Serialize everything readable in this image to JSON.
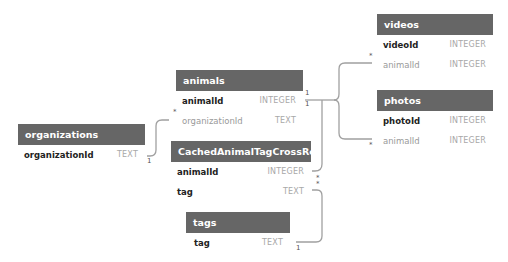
{
  "tables": {
    "organizations": {
      "name": "organizations",
      "columns": [
        {
          "name": "organizationId",
          "type": "TEXT",
          "key": "pk"
        }
      ]
    },
    "animals": {
      "name": "animals",
      "columns": [
        {
          "name": "animalId",
          "type": "INTEGER",
          "key": "pk"
        },
        {
          "name": "organizationId",
          "type": "TEXT",
          "key": "fk"
        }
      ]
    },
    "cachedAnimalTagCrossRef": {
      "name": "CachedAnimalTagCrossRef",
      "columns": [
        {
          "name": "animalId",
          "type": "INTEGER",
          "key": "pk"
        },
        {
          "name": "tag",
          "type": "TEXT",
          "key": "pk"
        }
      ]
    },
    "tags": {
      "name": "tags",
      "columns": [
        {
          "name": "tag",
          "type": "TEXT",
          "key": "pk"
        }
      ]
    },
    "videos": {
      "name": "videos",
      "columns": [
        {
          "name": "videoId",
          "type": "INTEGER",
          "key": "pk"
        },
        {
          "name": "animalId",
          "type": "INTEGER",
          "key": "fk"
        }
      ]
    },
    "photos": {
      "name": "photos",
      "columns": [
        {
          "name": "photoId",
          "type": "INTEGER",
          "key": "pk"
        },
        {
          "name": "animalId",
          "type": "INTEGER",
          "key": "fk"
        }
      ]
    }
  },
  "cardinality": {
    "one": "1",
    "many": "*"
  },
  "colors": {
    "header_bg": "#666666",
    "header_text": "#ffffff",
    "link": "#999999"
  }
}
